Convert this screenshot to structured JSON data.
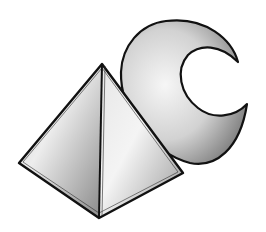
{
  "illustration": {
    "subject": "Pyramid and crescent moon",
    "shapes": [
      {
        "name": "pyramid",
        "fill_light": "#f2f2f2",
        "fill_dark": "#8a8a8a"
      },
      {
        "name": "crescent-moon",
        "fill_light": "#f4f4f4",
        "fill_dark": "#7c7c7c"
      }
    ],
    "outline_color": "#111111",
    "background": "#ffffff"
  }
}
